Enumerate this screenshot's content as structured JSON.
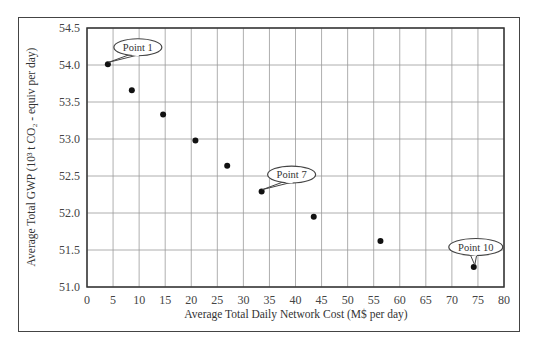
{
  "chart_data": {
    "type": "scatter",
    "title": "",
    "xlabel": "Average Total Daily Network Cost (M$ per day)",
    "ylabel": "Average Total GWP (10³ t CO₂ - equiv per day)",
    "xlim": [
      0,
      80
    ],
    "ylim": [
      51.0,
      54.5
    ],
    "xticks": [
      0,
      5,
      10,
      15,
      20,
      25,
      30,
      35,
      40,
      45,
      50,
      55,
      60,
      65,
      70,
      75,
      80
    ],
    "yticks": [
      51.0,
      51.5,
      52.0,
      52.5,
      53.0,
      53.5,
      54.0,
      54.5
    ],
    "grid": true,
    "legend": null,
    "series": [
      {
        "name": "Pareto points",
        "points": [
          {
            "id": 1,
            "x": 4.0,
            "y": 54.01
          },
          {
            "id": 2,
            "x": 8.6,
            "y": 53.66
          },
          {
            "id": 3,
            "x": 14.6,
            "y": 53.33
          },
          {
            "id": 4,
            "x": 20.8,
            "y": 52.98
          },
          {
            "id": 5,
            "x": 26.9,
            "y": 52.64
          },
          {
            "id": 7,
            "x": 33.5,
            "y": 52.29
          },
          {
            "id": 8,
            "x": 43.5,
            "y": 51.95
          },
          {
            "id": 9,
            "x": 56.3,
            "y": 51.62
          },
          {
            "id": 10,
            "x": 74.2,
            "y": 51.27
          }
        ]
      }
    ],
    "annotations": [
      {
        "label": "Point 1",
        "point_index": 0
      },
      {
        "label": "Point 7",
        "point_index": 5
      },
      {
        "label": "Point 10",
        "point_index": 8
      }
    ]
  },
  "labels": {
    "xlabel": "Average Total Daily Network Cost (M$ per day)",
    "ylabel": "Average Total GWP (10³ t CO₂ - equiv per day)"
  },
  "colors": {
    "marker": "#111111",
    "grid": "#9a9a9a",
    "axis": "#333333"
  }
}
